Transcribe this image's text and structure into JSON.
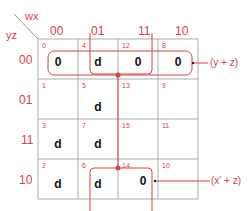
{
  "title_vars": {
    "columns": "wx",
    "rows": "yz"
  },
  "column_headers": [
    "00",
    "01",
    "11",
    "10"
  ],
  "row_headers": [
    "00",
    "01",
    "11",
    "10"
  ],
  "cells": [
    [
      {
        "index": "0",
        "value": "0"
      },
      {
        "index": "4",
        "value": "d"
      },
      {
        "index": "12",
        "value": "0"
      },
      {
        "index": "8",
        "value": "0"
      }
    ],
    [
      {
        "index": "1",
        "value": ""
      },
      {
        "index": "5",
        "value": "d"
      },
      {
        "index": "13",
        "value": ""
      },
      {
        "index": "9",
        "value": ""
      }
    ],
    [
      {
        "index": "3",
        "value": "d"
      },
      {
        "index": "7",
        "value": "d"
      },
      {
        "index": "15",
        "value": ""
      },
      {
        "index": "11",
        "value": ""
      }
    ],
    [
      {
        "index": "2",
        "value": "d"
      },
      {
        "index": "6",
        "value": "d"
      },
      {
        "index": "14",
        "value": "0"
      },
      {
        "index": "10",
        "value": ""
      }
    ]
  ],
  "groups": [
    {
      "label": "(y + z)",
      "cells": [
        "0",
        "4",
        "12",
        "8"
      ]
    },
    {
      "label": "(x' + z)",
      "cells": [
        "4",
        "12",
        "6",
        "14"
      ]
    }
  ],
  "colors": {
    "accent": "#d9414a",
    "grid": "#9a9a9a",
    "text": "#111111"
  }
}
